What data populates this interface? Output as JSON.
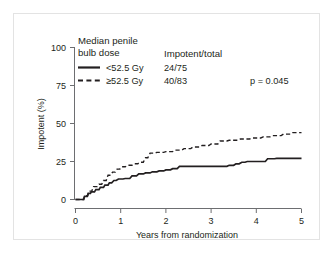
{
  "chart_data": {
    "type": "line",
    "title": "",
    "xlabel": "Years from randomization",
    "ylabel": "Impotent (%)",
    "xlim": [
      0,
      5
    ],
    "ylim": [
      0,
      100
    ],
    "xticks": [
      "0",
      "1",
      "2",
      "3",
      "4",
      "5"
    ],
    "yticks": [
      "0",
      "25",
      "50",
      "75",
      "100"
    ],
    "grid": false,
    "legend_position": "top-left-inside",
    "legend_title_line1": "Median penile",
    "legend_title_line2": "bulb dose",
    "stats_header": "Impotent/total",
    "pvalue_label": "p = 0.045",
    "series": [
      {
        "name": "<52.5 Gy",
        "style": "solid",
        "events_total": "24/75",
        "x": [
          0,
          0.18,
          0.2,
          0.26,
          0.28,
          0.33,
          0.35,
          0.42,
          0.45,
          0.52,
          0.55,
          0.62,
          0.65,
          0.72,
          0.75,
          0.8,
          0.85,
          0.9,
          0.95,
          1.05,
          1.1,
          1.2,
          1.25,
          1.35,
          1.4,
          1.5,
          1.55,
          1.65,
          1.7,
          1.8,
          1.85,
          1.95,
          2.0,
          2.1,
          2.15,
          2.25,
          2.3,
          3.35,
          3.4,
          3.5,
          3.55,
          3.62,
          3.68,
          3.75,
          3.8,
          4.2,
          4.25,
          4.4,
          4.45,
          5.0
        ],
        "y": [
          0,
          0,
          2.0,
          2.0,
          4.0,
          4.0,
          5.0,
          5.0,
          6.5,
          6.5,
          8.0,
          8.0,
          9.5,
          9.5,
          11.0,
          11.0,
          12.5,
          12.5,
          13.5,
          13.5,
          13.8,
          13.8,
          15.5,
          15.5,
          16.8,
          16.8,
          17.5,
          17.5,
          18.2,
          18.2,
          18.8,
          18.8,
          19.5,
          19.5,
          20.3,
          20.3,
          21.8,
          21.8,
          22.5,
          22.5,
          23.5,
          23.5,
          24.5,
          24.5,
          25.0,
          25.0,
          26.8,
          26.8,
          27.0,
          27.0
        ]
      },
      {
        "name": "≥52.5 Gy",
        "style": "dashed",
        "events_total": "40/83",
        "x": [
          0,
          0.18,
          0.2,
          0.27,
          0.3,
          0.36,
          0.4,
          0.48,
          0.52,
          0.58,
          0.62,
          0.68,
          0.72,
          0.78,
          0.82,
          0.88,
          0.92,
          0.98,
          1.02,
          1.1,
          1.15,
          1.25,
          1.3,
          1.38,
          1.42,
          1.5,
          1.55,
          1.6,
          1.65,
          1.75,
          1.8,
          1.95,
          2.0,
          2.15,
          2.2,
          2.35,
          2.4,
          2.55,
          2.6,
          2.75,
          2.8,
          2.95,
          3.0,
          3.15,
          3.2,
          3.35,
          3.4,
          3.6,
          3.65,
          3.85,
          3.9,
          4.1,
          4.15,
          4.3,
          4.35,
          4.55,
          4.6,
          4.75,
          4.8,
          5.0
        ],
        "y": [
          0,
          0,
          2.5,
          2.5,
          5.5,
          5.5,
          8.5,
          8.5,
          10.0,
          10.0,
          12.5,
          12.5,
          16.0,
          16.0,
          18.0,
          18.0,
          20.0,
          20.0,
          21.5,
          21.5,
          22.5,
          22.5,
          23.5,
          23.5,
          24.5,
          24.5,
          27.5,
          27.5,
          30.5,
          30.5,
          31.0,
          31.0,
          31.5,
          31.5,
          32.5,
          32.5,
          33.5,
          33.5,
          34.5,
          34.5,
          35.5,
          35.5,
          36.5,
          36.5,
          38.5,
          38.5,
          39.0,
          39.0,
          39.8,
          39.8,
          40.5,
          40.5,
          41.2,
          41.2,
          42.0,
          42.0,
          43.0,
          43.0,
          44.0,
          44.0
        ]
      }
    ]
  }
}
